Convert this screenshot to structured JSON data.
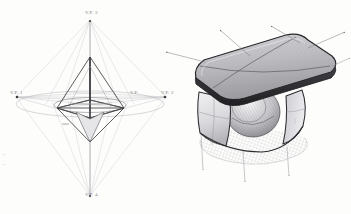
{
  "sketch": {
    "title": "Three-point perspective construction with rendered stool",
    "medium": "pencil and ink on paper",
    "paper_color": "#fdfdfc",
    "ink_color": "#3a3a3d",
    "construction_line_color": "#b9b9bd",
    "shade_color": "#8e8e92"
  },
  "left_diagram": {
    "name": "three-point perspective octahedron construction",
    "vanishing_points": [
      {
        "id": "vp-top",
        "label": "V.P. 3",
        "x": 90,
        "y": 18
      },
      {
        "id": "vp-left",
        "label": "V.P. 1",
        "x": 16,
        "y": 97
      },
      {
        "id": "vp-right",
        "label": "V.P. 2",
        "x": 166,
        "y": 97
      },
      {
        "id": "vp-bottom",
        "label": "V.P. 4",
        "x": 90,
        "y": 198
      }
    ],
    "center_label": "V.P.",
    "upper_apex": {
      "x": 90,
      "y": 57
    },
    "lower_apex": {
      "x": 90,
      "y": 142
    },
    "base_left": {
      "x": 57,
      "y": 108
    },
    "base_right": {
      "x": 124,
      "y": 108
    },
    "base_front": {
      "x": 90,
      "y": 118
    },
    "base_back": {
      "x": 90,
      "y": 100
    }
  },
  "right_object": {
    "name": "rounded stool with curved seat recess",
    "top_panels": 4,
    "has_ground_shadow": true,
    "shadow_style": "cross-hatched",
    "guide_arrows": [
      {
        "id": "arrow-top-left",
        "direction": "up-left"
      },
      {
        "id": "arrow-top-mid",
        "direction": "up-right"
      },
      {
        "id": "arrow-top-right",
        "direction": "up-right"
      },
      {
        "id": "arrow-side-right",
        "direction": "right"
      },
      {
        "id": "arrow-drop-left",
        "direction": "down"
      },
      {
        "id": "arrow-drop-mid",
        "direction": "down"
      },
      {
        "id": "arrow-drop-right",
        "direction": "down"
      }
    ]
  },
  "margin_marks": {
    "mark_a": "≡",
    "mark_b": "≡"
  }
}
